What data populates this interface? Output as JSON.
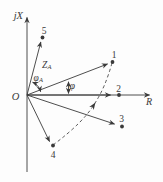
{
  "figure": {
    "type": "impedance-plane-vector-diagram",
    "colors": {
      "ink": "#3a3a3a",
      "background": "#fdfdfd"
    },
    "axes": {
      "vertical_label": "jX",
      "horizontal_label": "R",
      "origin_label": "O"
    },
    "points": [
      {
        "label": "1"
      },
      {
        "label": "2"
      },
      {
        "label": "3"
      },
      {
        "label": "4"
      },
      {
        "label": "5"
      }
    ],
    "labels": {
      "impedance_vector": {
        "base": "Z",
        "subscript": "A"
      },
      "angle_at_impedance": {
        "base": "φ",
        "subscript": "A"
      },
      "angle_phi": "φ"
    }
  }
}
